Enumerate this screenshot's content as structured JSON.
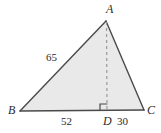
{
  "figure": {
    "type": "geometry-diagram",
    "background_color": "#ffffff",
    "fill_color": "#e9e9e9",
    "stroke_color": "#4a4a4a",
    "dash_color": "#9a9a9a",
    "text_color": "#2b2b2b"
  },
  "vertices": [
    {
      "name": "A",
      "label": "A",
      "x": 106,
      "y": 21,
      "role": "apex"
    },
    {
      "name": "B",
      "label": "B",
      "x": 20,
      "y": 111,
      "role": "base-left"
    },
    {
      "name": "C",
      "label": "C",
      "x": 144,
      "y": 110,
      "role": "base-right"
    },
    {
      "name": "D",
      "label": "D",
      "x": 107,
      "y": 111,
      "role": "foot-of-altitude"
    }
  ],
  "segments": [
    {
      "name": "AB",
      "measure": "65",
      "style": "solid"
    },
    {
      "name": "BD",
      "measure": "52",
      "style": "solid"
    },
    {
      "name": "DC",
      "measure": "30",
      "style": "solid"
    },
    {
      "name": "AC",
      "measure": "",
      "style": "solid"
    },
    {
      "name": "AD",
      "measure": "",
      "style": "dashed"
    }
  ],
  "measures": {
    "ab": "65",
    "bd": "52",
    "dc": "30"
  },
  "markers": {
    "right_angle": {
      "at": "D",
      "label": "right-angle-marker",
      "description": "square marker indicating AD is perpendicular to BC"
    }
  }
}
